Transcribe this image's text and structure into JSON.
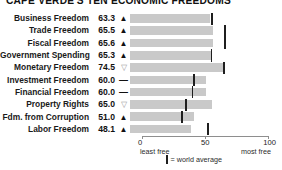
{
  "title": "CAPE VERDE'S TEN ECONOMIC FREEDOMS",
  "axis": {
    "ticks": [
      {
        "value": 0,
        "label": "0"
      },
      {
        "value": 50,
        "label": "50"
      },
      {
        "value": 100,
        "label": "100"
      }
    ],
    "left_caption": "least free",
    "right_caption": "most free",
    "min": 0,
    "max": 100
  },
  "legend": {
    "marker_name": "world-average-marker",
    "text": "= world average"
  },
  "colors": {
    "bar": "#c9c9c9",
    "average_marker": "#1f1f1f",
    "text": "#1a1a1a",
    "axis": "#8e8e8e",
    "down_symbol": "#9a9a9a"
  },
  "symbols": {
    "up": "▲",
    "down": "▽",
    "flat": "—"
  },
  "chart_data": {
    "type": "bar",
    "title": "CAPE VERDE'S TEN ECONOMIC FREEDOMS",
    "xlabel": "",
    "ylabel": "",
    "xlim": [
      0,
      100
    ],
    "grid": false,
    "legend_position": "bottom",
    "orientation": "horizontal",
    "categories": [
      "Business Freedom",
      "Trade Freedom",
      "Fiscal Freedom",
      "Government Spending",
      "Monetary Freedom",
      "Investment Freedom",
      "Financial Freedom",
      "Property Rights",
      "Fdm. from Corruption",
      "Labor Freedom"
    ],
    "values": [
      63.3,
      65.5,
      65.6,
      65.3,
      74.5,
      60.0,
      60.0,
      65.0,
      51.0,
      48.1
    ],
    "trend": [
      "up",
      "up",
      "up",
      "up",
      "down",
      "flat",
      "flat",
      "down",
      "up",
      "up"
    ],
    "world_average": [
      64.3,
      74.8,
      74.9,
      63.9,
      74.2,
      50.2,
      49.0,
      43.8,
      40.5,
      61.5
    ],
    "series": [
      {
        "name": "Cape Verde score",
        "values": [
          63.3,
          65.5,
          65.6,
          65.3,
          74.5,
          60.0,
          60.0,
          65.0,
          51.0,
          48.1
        ]
      },
      {
        "name": "world average",
        "values": [
          64.3,
          74.8,
          74.9,
          63.9,
          74.2,
          50.2,
          49.0,
          43.8,
          40.5,
          61.5
        ]
      }
    ]
  },
  "rows": [
    {
      "label": "Business Freedom",
      "value": "63.3",
      "trend": "up",
      "score": 63.3,
      "avg": 64.3
    },
    {
      "label": "Trade Freedom",
      "value": "65.5",
      "trend": "up",
      "score": 65.5,
      "avg": 74.8
    },
    {
      "label": "Fiscal Freedom",
      "value": "65.6",
      "trend": "up",
      "score": 65.6,
      "avg": 74.9
    },
    {
      "label": "Government Spending",
      "value": "65.3",
      "trend": "up",
      "score": 65.3,
      "avg": 63.9
    },
    {
      "label": "Monetary Freedom",
      "value": "74.5",
      "trend": "down",
      "score": 74.5,
      "avg": 74.2
    },
    {
      "label": "Investment Freedom",
      "value": "60.0",
      "trend": "flat",
      "score": 60.0,
      "avg": 50.2
    },
    {
      "label": "Financial Freedom",
      "value": "60.0",
      "trend": "flat",
      "score": 60.0,
      "avg": 49.0
    },
    {
      "label": "Property Rights",
      "value": "65.0",
      "trend": "down",
      "score": 65.0,
      "avg": 43.8
    },
    {
      "label": "Fdm. from Corruption",
      "value": "51.0",
      "trend": "up",
      "score": 51.0,
      "avg": 40.5
    },
    {
      "label": "Labor Freedom",
      "value": "48.1",
      "trend": "up",
      "score": 48.1,
      "avg": 61.5
    }
  ]
}
